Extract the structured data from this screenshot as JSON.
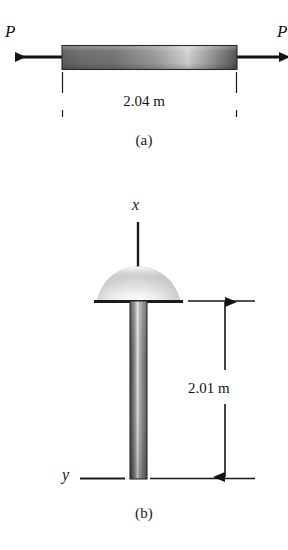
{
  "figure": {
    "background_color": "#ffffff",
    "ink_color": "#141414",
    "panels": [
      {
        "id": "a",
        "caption": "(a)",
        "description": "axially loaded bar in tension",
        "force_label_left": "P",
        "force_label_right": "P",
        "dimension_label": "2.04 m",
        "dimension_value": 2.04,
        "dimension_unit": "m",
        "bar_fill_colors": [
          "#5b5b5b",
          "#6f6f6f",
          "#d8d8d8",
          "#8e8e8e",
          "#4f4f4f"
        ]
      },
      {
        "id": "b",
        "caption": "(b)",
        "description": "vertical rivet-like shaft with domed head, x axis above, y axis at base",
        "axis_label_top": "x",
        "axis_label_bottom": "y",
        "dimension_label": "2.01 m",
        "dimension_value": 2.01,
        "dimension_unit": "m",
        "shaft_fill_colors": [
          "#3f3f3f",
          "#707070",
          "#e2e2e2",
          "#9a9a9a",
          "#5a5a5a"
        ],
        "cap_fill_colors": [
          "#ffffff",
          "#c9c9c9",
          "#8c8c8c"
        ]
      }
    ]
  }
}
